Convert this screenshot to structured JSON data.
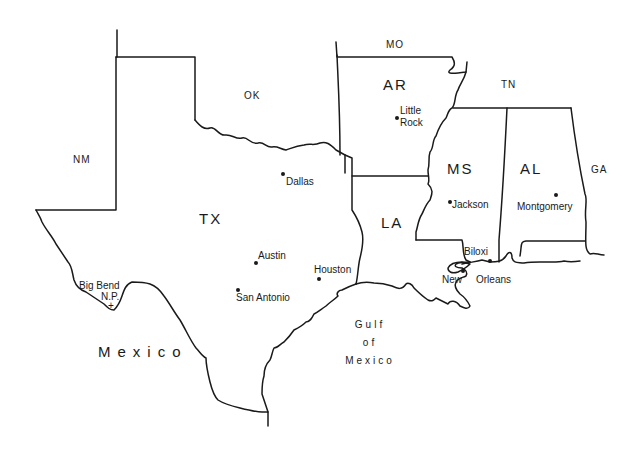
{
  "map": {
    "states": {
      "nm": "NM",
      "ok": "OK",
      "mo": "MO",
      "ar": "AR",
      "tn": "TN",
      "tx": "TX",
      "la": "LA",
      "ms": "MS",
      "al": "AL",
      "ga": "GA"
    },
    "cities": {
      "dallas": "Dallas",
      "little_rock_1": "Little",
      "little_rock_2": "Rock",
      "jackson": "Jackson",
      "montgomery": "Montgomery",
      "austin": "Austin",
      "san_antonio": "San Antonio",
      "houston": "Houston",
      "biloxi": "Biloxi",
      "new_orleans_1": "New",
      "new_orleans_2": "Orleans"
    },
    "landmarks": {
      "big_bend_1": "Big Bend",
      "big_bend_2": "N.P.",
      "big_bend_marker": "+"
    },
    "regions": {
      "mexico": "Mexico",
      "gulf_1": "Gulf",
      "gulf_2": "of",
      "gulf_3": "Mexico"
    },
    "colors": {
      "ink": "#1a1a1a",
      "background": "#ffffff"
    }
  }
}
